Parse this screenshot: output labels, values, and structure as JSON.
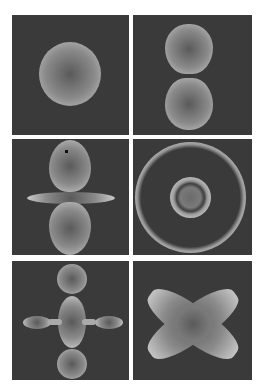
{
  "figure": {
    "panels": [
      {
        "id": "p1",
        "shape": "sphere"
      },
      {
        "id": "p2",
        "shape": "two-lobes-vertical"
      },
      {
        "id": "p3",
        "shape": "two-lobes-with-torus"
      },
      {
        "id": "p4",
        "shape": "concentric-rings"
      },
      {
        "id": "p5",
        "shape": "lobes-with-chain"
      },
      {
        "id": "p6",
        "shape": "four-lobe-clover"
      }
    ],
    "colors": {
      "background": "#3a3a3a",
      "highlight": "#c8c8c8",
      "core": "#5a5a5a",
      "gutter": "#ffffff"
    }
  }
}
